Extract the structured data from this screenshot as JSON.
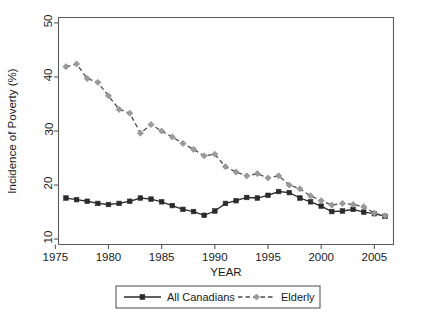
{
  "chart_data": {
    "type": "line",
    "title": "",
    "xlabel": "YEAR",
    "ylabel": "Incidence of Poverty (%)",
    "xlim": [
      1975.3,
      2006.8
    ],
    "ylim": [
      9.0,
      51.0
    ],
    "xticks": [
      1975,
      1980,
      1985,
      1990,
      1995,
      2000,
      2005
    ],
    "xticklabels": [
      "1975",
      "1980",
      "1985",
      "1990",
      "1995",
      "2000",
      "2005"
    ],
    "yticks": [
      10,
      20,
      30,
      40,
      50
    ],
    "yticklabels": [
      "10",
      "20",
      "30",
      "40",
      "50"
    ],
    "grid": false,
    "legend_position": "below-center",
    "x": [
      1976,
      1977,
      1978,
      1979,
      1980,
      1981,
      1982,
      1983,
      1984,
      1985,
      1986,
      1987,
      1988,
      1989,
      1990,
      1991,
      1992,
      1993,
      1994,
      1995,
      1996,
      1997,
      1998,
      1999,
      2000,
      2001,
      2002,
      2003,
      2004,
      2005,
      2006
    ],
    "series": [
      {
        "name": "All Canadians",
        "marker": "square",
        "linestyle": "solid",
        "color": "#2b2b2b",
        "values": [
          17.6,
          17.3,
          17.0,
          16.6,
          16.4,
          16.6,
          17.0,
          17.6,
          17.4,
          16.9,
          16.2,
          15.5,
          15.1,
          14.4,
          15.2,
          16.6,
          17.1,
          17.7,
          17.6,
          18.1,
          18.8,
          18.6,
          17.6,
          16.9,
          16.1,
          15.1,
          15.2,
          15.5,
          15.0,
          14.7,
          14.2
        ]
      },
      {
        "name": "Elderly",
        "marker": "diamond",
        "linestyle": "dashed",
        "color": "#9a9a9a",
        "values": [
          41.9,
          42.4,
          39.7,
          39.0,
          36.5,
          34.0,
          33.3,
          29.6,
          31.2,
          30.0,
          28.9,
          27.7,
          26.6,
          25.4,
          25.7,
          23.4,
          22.4,
          21.7,
          22.1,
          21.3,
          21.7,
          20.0,
          19.3,
          18.0,
          17.1,
          16.3,
          16.6,
          16.4,
          16.0,
          14.8,
          14.3
        ]
      }
    ]
  },
  "legend": {
    "entries": [
      {
        "label": "All Canadians"
      },
      {
        "label": "Elderly"
      }
    ]
  }
}
